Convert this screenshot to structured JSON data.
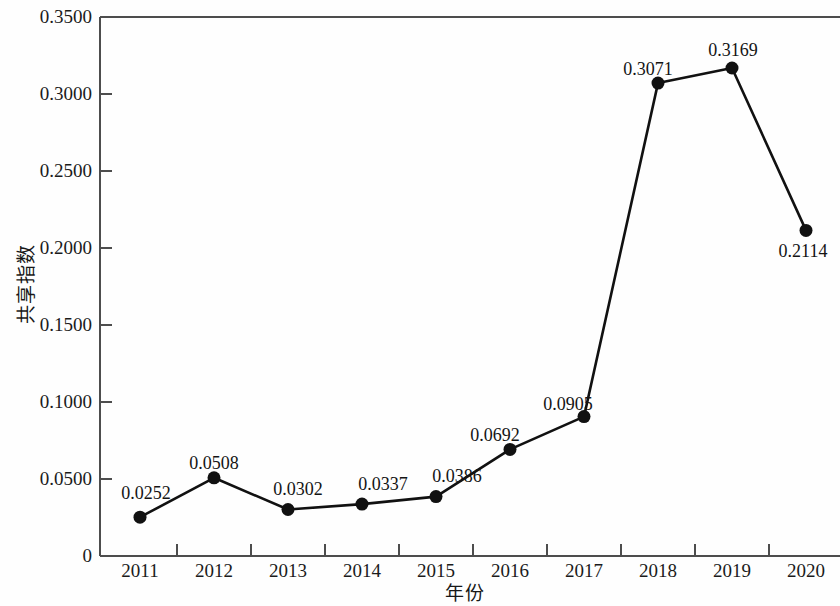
{
  "chart_data": {
    "type": "line",
    "title": "",
    "subtitle": "",
    "xlabel": "年份",
    "ylabel": "共享指数",
    "categories": [
      "2011",
      "2012",
      "2013",
      "2014",
      "2015",
      "2016",
      "2017",
      "2018",
      "2019",
      "2020"
    ],
    "values": [
      0.0252,
      0.0508,
      0.0302,
      0.0337,
      0.0386,
      0.0692,
      0.0905,
      0.3071,
      0.3169,
      0.2114
    ],
    "point_labels": [
      "0.0252",
      "0.0508",
      "0.0302",
      "0.0337",
      "0.0386",
      "0.0692",
      "0.0905",
      "0.3071",
      "0.3169",
      "0.2114"
    ],
    "series": [
      {
        "name": "共享指数",
        "values": [
          0.0252,
          0.0508,
          0.0302,
          0.0337,
          0.0386,
          0.0692,
          0.0905,
          0.3071,
          0.3169,
          0.2114
        ]
      }
    ],
    "ylim": [
      0,
      0.35
    ],
    "ytick_labels": [
      "0.3500",
      "0.3000",
      "0.2500",
      "0.2000",
      "0.1500",
      "0.1000",
      "0.0500",
      "0"
    ],
    "ytick_values": [
      0.35,
      0.3,
      0.25,
      0.2,
      0.15,
      0.1,
      0.05,
      0
    ],
    "xtick_labels": [
      "2011",
      "2012",
      "2013",
      "2014",
      "2015",
      "2016",
      "2017",
      "2018",
      "2019",
      "2020"
    ],
    "grid": false,
    "legend": "none",
    "marker": "filled-circle",
    "line_color": "#111111",
    "marker_color": "#111111",
    "background_color": "#fefefe",
    "axis_color": "#4a4a4a"
  }
}
